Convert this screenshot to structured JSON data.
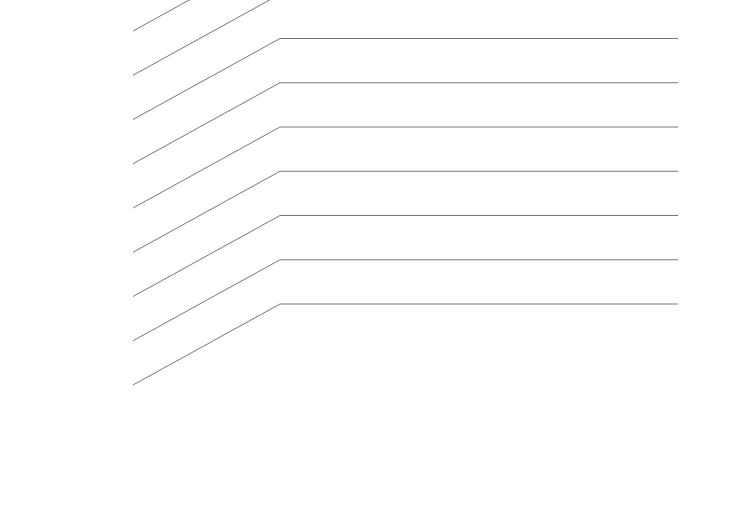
{
  "chart_data": {
    "type": "bar",
    "render": "3d-grouped-bar",
    "title": "",
    "xlabel": "Year of projection",
    "ylabel": "Mortality count",
    "categories": [
      "2005",
      "2010",
      "2015",
      "2020"
    ],
    "ytick_labels": [
      "0",
      "100,000",
      "200,000",
      "300,000",
      "400,000",
      "500,000",
      "600,000",
      "700,000",
      "800,000"
    ],
    "ytick_values": [
      0,
      100000,
      200000,
      300000,
      400000,
      500000,
      600000,
      700000,
      800000
    ],
    "ylim": [
      0,
      800000
    ],
    "grid": true,
    "legend_position": "depth-axis-right",
    "series": [
      {
        "name": "developed country",
        "color": "#ffffff",
        "side_color": "#8d8d8d",
        "top_color": "#d8d8d8",
        "depth_index": 0,
        "values": [
          60000,
          75000,
          85000,
          105000
        ]
      },
      {
        "name": "developing country",
        "color": "#b8b8b8",
        "side_color": "#7c7c7c",
        "top_color": "#cfcfcf",
        "depth_index": 1,
        "values": [
          155000,
          290000,
          500000,
          560000
        ]
      },
      {
        "name": "total",
        "color": "#111111",
        "side_color": "#2a2a2a",
        "top_color": "#3a3a3a",
        "depth_index": 2,
        "values": [
          215000,
          380000,
          600000,
          685000
        ]
      }
    ],
    "floor_color": "#8f8f8f",
    "wall_color": "#ffffff",
    "gridline_color": "#666666"
  },
  "axis": {
    "y_title": "Mortality count",
    "x_title": "Year of projection"
  },
  "series_labels": {
    "total": "total",
    "developing": "developing country",
    "developed": "developed country"
  }
}
